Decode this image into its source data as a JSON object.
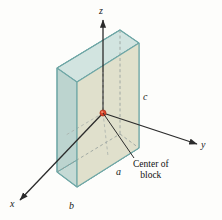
{
  "figure": {
    "background_color": "#fdfdfb",
    "axes": {
      "z": {
        "label": "z",
        "direction": "up"
      },
      "y": {
        "label": "y",
        "direction": "right"
      },
      "x": {
        "label": "x",
        "direction": "down-left"
      },
      "line_color": "#2b2b2b"
    },
    "dimensions": [
      {
        "name": "edge-a",
        "label": "a"
      },
      {
        "name": "edge-b",
        "label": "b"
      },
      {
        "name": "edge-c",
        "label": "c"
      }
    ],
    "annotation": {
      "line1": "Center of",
      "line2": "block",
      "marker_color": "#d9442a"
    },
    "block": {
      "front_face_color": "#ddddc8",
      "left_face_color": "#b9d2cd",
      "top_face_color": "#cfe2de",
      "bottom_face_color": "#c3d8d4",
      "edge_color": "#6fa7a6",
      "hidden_edge_color": "#9aa39e"
    }
  }
}
